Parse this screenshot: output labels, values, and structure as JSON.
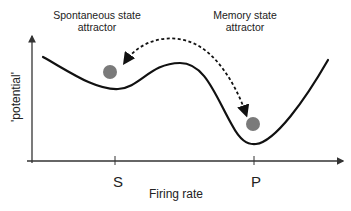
{
  "diagram": {
    "labels": {
      "spontaneous_line1": "Spontaneous state",
      "spontaneous_line2": "attractor",
      "memory_line1": "Memory state",
      "memory_line2": "attractor"
    },
    "axes": {
      "x_label": "Firing rate",
      "y_label": "'potential'",
      "x_ticks": [
        {
          "label": "S",
          "x": 115
        },
        {
          "label": "P",
          "x": 254
        }
      ]
    },
    "elements": {
      "potential_curve": "double-well potential curve",
      "ball_spontaneous": {
        "x": 110,
        "y": 72,
        "r": 7,
        "color": "#7a7a7a"
      },
      "ball_memory": {
        "x": 253,
        "y": 124,
        "r": 7,
        "color": "#7a7a7a"
      },
      "transition_arrow": "dashed bidirectional arrow between attractors"
    },
    "colors": {
      "line": "#111111",
      "axis": "#333333",
      "ball": "#7a7a7a",
      "text": "#222222"
    }
  }
}
